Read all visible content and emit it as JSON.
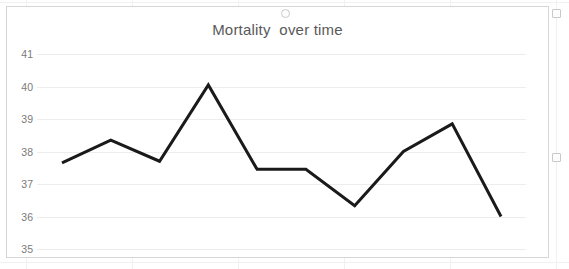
{
  "chart": {
    "title": "Mortality  over time",
    "title_color": "#595959",
    "line_color": "#1a1a1a",
    "gridline_color": "#ededed",
    "border_color": "#d6d6d6",
    "tick_label_color": "#7a7a7a"
  },
  "chart_data": {
    "type": "line",
    "title": "Mortality  over time",
    "xlabel": "",
    "ylabel": "",
    "ylim": [
      35,
      41
    ],
    "ytick_labels": [
      "41",
      "40",
      "39",
      "38",
      "37",
      "36",
      "35"
    ],
    "yticks": [
      41,
      40,
      39,
      38,
      37,
      36,
      35
    ],
    "grid": true,
    "legend": false,
    "x": [
      1,
      2,
      3,
      4,
      5,
      6,
      7,
      8,
      9,
      10
    ],
    "series": [
      {
        "name": "Mortality",
        "values": [
          37.65,
          38.35,
          37.7,
          40.05,
          37.45,
          37.45,
          36.33,
          38.0,
          38.85,
          36.0
        ]
      }
    ]
  },
  "selection": {
    "handles": [
      "top-center",
      "top-right",
      "middle-right"
    ]
  }
}
